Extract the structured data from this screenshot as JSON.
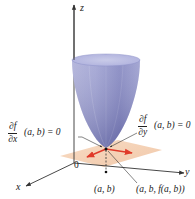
{
  "diagram": {
    "type": "3d-surface-illustration",
    "axes": {
      "z_label": "z",
      "y_label": "y",
      "x_label": "x",
      "origin_label": "0"
    },
    "annotations": {
      "partial_x": {
        "numerator": "∂f",
        "denominator": "∂x",
        "rest": "(a, b) = 0"
      },
      "partial_y": {
        "numerator": "∂f",
        "denominator": "∂y",
        "rest": "(a, b) = 0"
      },
      "point_ab": "(a, b)",
      "point_abf": "(a, b, f(a, b))"
    },
    "colors": {
      "surface": "#8f92c8",
      "surface_dark": "#5a5c9a",
      "tangent_plane": "#f2c9a8",
      "tangent_arrows": "#e03a2a",
      "axes": "#333333"
    }
  }
}
